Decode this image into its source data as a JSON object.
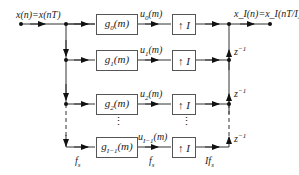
{
  "diagram": {
    "title": "",
    "input_label": "x(n)=x(nT)",
    "output_label": "x_I(n)=x_I(nT/I)",
    "branches": [
      {
        "filter": "g0(m)",
        "filter_base": "g",
        "filter_sub": "0",
        "filter_arg": "(m)",
        "signal": "u0(m)",
        "signal_base": "u",
        "signal_sub": "0",
        "signal_arg": "(m)",
        "upsampler": "↑ I"
      },
      {
        "filter": "g1(m)",
        "filter_base": "g",
        "filter_sub": "1",
        "filter_arg": "(m)",
        "signal": "u1(m)",
        "signal_base": "u",
        "signal_sub": "1",
        "signal_arg": "(m)",
        "upsampler": "↑ I"
      },
      {
        "filter": "g2(m)",
        "filter_base": "g",
        "filter_sub": "2",
        "filter_arg": "(m)",
        "signal": "u2(m)",
        "signal_base": "u",
        "signal_sub": "2",
        "signal_arg": "(m)",
        "upsampler": "↑ I"
      },
      {
        "filter": "gI-1(m)",
        "filter_base": "g",
        "filter_sub": "I−1",
        "filter_arg": "(m)",
        "signal": "uI-1(m)",
        "signal_base": "u",
        "signal_sub": "I−1",
        "signal_arg": "(m)",
        "upsampler": "↑ I"
      }
    ],
    "delays": [
      "z^-1",
      "z^-1",
      "z^-1"
    ],
    "delay_base": "z",
    "delay_exp": "−1",
    "ellipsis": "⋮",
    "rate_labels": {
      "input": "fs",
      "middle": "fs",
      "output": "Ifs"
    },
    "rate_base": "f",
    "rate_sub": "s",
    "rate_prefix_output": "I"
  }
}
